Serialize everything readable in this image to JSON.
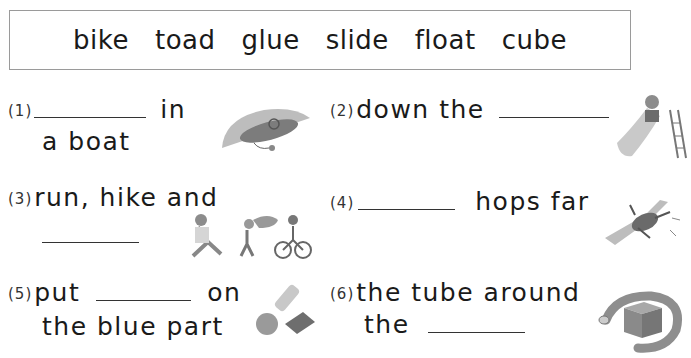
{
  "word_bank": [
    "bike",
    "toad",
    "glue",
    "slide",
    "float",
    "cube"
  ],
  "items": [
    {
      "number": "(1)",
      "line1_after": "in",
      "line2": "a boat",
      "picture": "boat-floating-icon"
    },
    {
      "number": "(2)",
      "line1_before": "down the",
      "picture": "child-on-slide-icon"
    },
    {
      "number": "(3)",
      "line1": "run, hike and",
      "picture": "run-hike-bike-icon"
    },
    {
      "number": "(4)",
      "line1_after": "hops far",
      "picture": "toad-hopping-icon"
    },
    {
      "number": "(5)",
      "line1_before": "put",
      "line1_after": "on",
      "line2": "the blue part",
      "picture": "glue-bottle-icon"
    },
    {
      "number": "(6)",
      "line1": "the tube around",
      "line2_before": "the",
      "picture": "tube-around-cube-icon"
    }
  ],
  "colors": {
    "text": "#1a1a1a",
    "border": "#9a9a9a",
    "picture_gray": "#8a8a8a"
  }
}
